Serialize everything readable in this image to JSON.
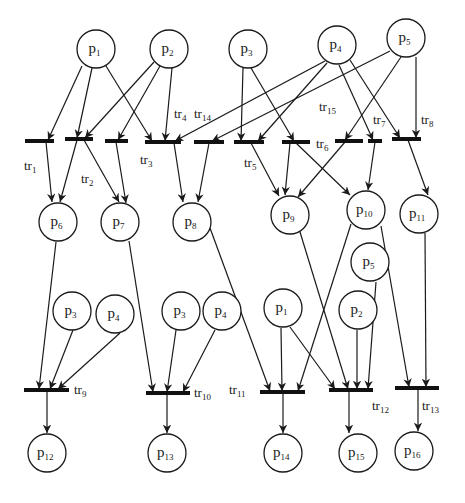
{
  "diagram": {
    "type": "petri-net",
    "colors": {
      "stroke": "#1a1a1a",
      "bar": "#111111",
      "background": "#ffffff"
    },
    "places": [
      {
        "id": "p1a",
        "base": "p",
        "sub": "1",
        "x": 96,
        "y": 49
      },
      {
        "id": "p2a",
        "base": "p",
        "sub": "2",
        "x": 169,
        "y": 49
      },
      {
        "id": "p3a",
        "base": "p",
        "sub": "3",
        "x": 248,
        "y": 49
      },
      {
        "id": "p4a",
        "base": "p",
        "sub": "4",
        "x": 337,
        "y": 45
      },
      {
        "id": "p5a",
        "base": "p",
        "sub": "5",
        "x": 406,
        "y": 38
      },
      {
        "id": "p6",
        "base": "p",
        "sub": "6",
        "x": 58,
        "y": 222
      },
      {
        "id": "p7",
        "base": "p",
        "sub": "7",
        "x": 120,
        "y": 222
      },
      {
        "id": "p8",
        "base": "p",
        "sub": "8",
        "x": 192,
        "y": 222
      },
      {
        "id": "p9",
        "base": "p",
        "sub": "9",
        "x": 290,
        "y": 215
      },
      {
        "id": "p10",
        "base": "p",
        "sub": "10",
        "x": 366,
        "y": 210
      },
      {
        "id": "p11",
        "base": "p",
        "sub": "11",
        "x": 419,
        "y": 214
      },
      {
        "id": "p5b",
        "base": "p",
        "sub": "5",
        "x": 370,
        "y": 262
      },
      {
        "id": "p3b",
        "base": "p",
        "sub": "3",
        "x": 72,
        "y": 311
      },
      {
        "id": "p4b",
        "base": "p",
        "sub": "4",
        "x": 115,
        "y": 314
      },
      {
        "id": "p3c",
        "base": "p",
        "sub": "3",
        "x": 181,
        "y": 311
      },
      {
        "id": "p4c",
        "base": "p",
        "sub": "4",
        "x": 222,
        "y": 311
      },
      {
        "id": "p1b",
        "base": "p",
        "sub": "1",
        "x": 283,
        "y": 308
      },
      {
        "id": "p2b",
        "base": "p",
        "sub": "2",
        "x": 358,
        "y": 310
      },
      {
        "id": "p12",
        "base": "p",
        "sub": "12",
        "x": 47,
        "y": 453
      },
      {
        "id": "p13",
        "base": "p",
        "sub": "13",
        "x": 167,
        "y": 453
      },
      {
        "id": "p14",
        "base": "p",
        "sub": "14",
        "x": 283,
        "y": 453
      },
      {
        "id": "p15",
        "base": "p",
        "sub": "15",
        "x": 358,
        "y": 453
      },
      {
        "id": "p16",
        "base": "p",
        "sub": "16",
        "x": 414,
        "y": 451
      }
    ],
    "transitions": [
      {
        "id": "tr1",
        "x1": 25,
        "x2": 54,
        "y": 141,
        "label": {
          "base": "tr",
          "sub": "1",
          "x": 24,
          "y": 170
        }
      },
      {
        "id": "tr2",
        "x1": 65,
        "x2": 93,
        "y": 139,
        "label": {
          "base": "tr",
          "sub": "2",
          "x": 81,
          "y": 183
        }
      },
      {
        "id": "tr4",
        "x1": 105,
        "x2": 128,
        "y": 141,
        "label": {
          "base": "tr",
          "sub": "4",
          "x": 174,
          "y": 118
        }
      },
      {
        "id": "tr3",
        "x1": 145,
        "x2": 181,
        "y": 142,
        "label": {
          "base": "tr",
          "sub": "3",
          "x": 140,
          "y": 164
        }
      },
      {
        "id": "tr14",
        "x1": 194,
        "x2": 224,
        "y": 142,
        "label": {
          "base": "tr",
          "sub": "14",
          "x": 194,
          "y": 118
        }
      },
      {
        "id": "tr5",
        "x1": 234,
        "x2": 264,
        "y": 142,
        "label": {
          "base": "tr",
          "sub": "5",
          "x": 244,
          "y": 167
        }
      },
      {
        "id": "tr6",
        "x1": 282,
        "x2": 310,
        "y": 142,
        "label": {
          "base": "tr",
          "sub": "6",
          "x": 316,
          "y": 148
        }
      },
      {
        "id": "tr15",
        "x1": 335,
        "x2": 363,
        "y": 141,
        "label": {
          "base": "tr",
          "sub": "15",
          "x": 319,
          "y": 111
        }
      },
      {
        "id": "tr7",
        "x1": 368,
        "x2": 382,
        "y": 141,
        "label": {
          "base": "tr",
          "sub": "7",
          "x": 373,
          "y": 124
        }
      },
      {
        "id": "tr8",
        "x1": 392,
        "x2": 421,
        "y": 139,
        "label": {
          "base": "tr",
          "sub": "8",
          "x": 421,
          "y": 124
        }
      },
      {
        "id": "tr9",
        "x1": 24,
        "x2": 69,
        "y": 390,
        "label": {
          "base": "tr",
          "sub": "9",
          "x": 74,
          "y": 394
        }
      },
      {
        "id": "tr10",
        "x1": 146,
        "x2": 190,
        "y": 393,
        "label": {
          "base": "tr",
          "sub": "10",
          "x": 194,
          "y": 397
        }
      },
      {
        "id": "tr11",
        "x1": 260,
        "x2": 305,
        "y": 392,
        "label": {
          "base": "tr",
          "sub": "11",
          "x": 229,
          "y": 394
        }
      },
      {
        "id": "tr12",
        "x1": 329,
        "x2": 373,
        "y": 390,
        "label": {
          "base": "tr",
          "sub": "12",
          "x": 372,
          "y": 410
        }
      },
      {
        "id": "tr13",
        "x1": 395,
        "x2": 439,
        "y": 388,
        "label": {
          "base": "tr",
          "sub": "13",
          "x": 422,
          "y": 410
        }
      }
    ],
    "arcs": [
      {
        "from": "p1a",
        "to": "tr1",
        "x1": 82,
        "y1": 66,
        "x2": 48,
        "y2": 140
      },
      {
        "from": "p1a",
        "to": "tr2",
        "x1": 92,
        "y1": 68,
        "x2": 77,
        "y2": 138
      },
      {
        "from": "p1a",
        "to": "tr3",
        "x1": 106,
        "y1": 66,
        "x2": 152,
        "y2": 141
      },
      {
        "from": "p2a",
        "to": "tr2",
        "x1": 154,
        "y1": 62,
        "x2": 85,
        "y2": 138
      },
      {
        "from": "p2a",
        "to": "tr4",
        "x1": 160,
        "y1": 66,
        "x2": 118,
        "y2": 140
      },
      {
        "from": "p2a",
        "to": "tr3",
        "x1": 172,
        "y1": 68,
        "x2": 165,
        "y2": 141
      },
      {
        "from": "p4a",
        "to": "tr3",
        "x1": 325,
        "y1": 61,
        "x2": 175,
        "y2": 141
      },
      {
        "from": "p5a",
        "to": "tr14",
        "x1": 390,
        "y1": 51,
        "x2": 212,
        "y2": 141
      },
      {
        "from": "p4a",
        "to": "tr5",
        "x1": 327,
        "y1": 63,
        "x2": 258,
        "y2": 141
      },
      {
        "from": "p3a",
        "to": "tr5",
        "x1": 243,
        "y1": 68,
        "x2": 241,
        "y2": 141
      },
      {
        "from": "p3a",
        "to": "tr6",
        "x1": 251,
        "y1": 68,
        "x2": 294,
        "y2": 141
      },
      {
        "from": "p5a",
        "to": "tr15",
        "x1": 401,
        "y1": 57,
        "x2": 345,
        "y2": 140
      },
      {
        "from": "p4a",
        "to": "tr7",
        "x1": 339,
        "y1": 65,
        "x2": 373,
        "y2": 140
      },
      {
        "from": "p4a",
        "to": "tr8",
        "x1": 350,
        "y1": 60,
        "x2": 400,
        "y2": 138
      },
      {
        "from": "p5a",
        "to": "tr8",
        "x1": 416,
        "y1": 57,
        "x2": 416,
        "y2": 138
      },
      {
        "from": "tr1",
        "to": "p6",
        "x1": 46,
        "y1": 142,
        "x2": 52,
        "y2": 202
      },
      {
        "from": "tr2",
        "to": "p6",
        "x1": 77,
        "y1": 140,
        "x2": 60,
        "y2": 202
      },
      {
        "from": "tr2",
        "to": "p7",
        "x1": 84,
        "y1": 140,
        "x2": 119,
        "y2": 202
      },
      {
        "from": "tr4",
        "to": "p7",
        "x1": 116,
        "y1": 142,
        "x2": 126,
        "y2": 203
      },
      {
        "from": "tr3",
        "to": "p8",
        "x1": 174,
        "y1": 143,
        "x2": 183,
        "y2": 202
      },
      {
        "from": "tr14",
        "to": "p8",
        "x1": 209,
        "y1": 143,
        "x2": 198,
        "y2": 202
      },
      {
        "from": "tr5",
        "to": "p9",
        "x1": 251,
        "y1": 143,
        "x2": 279,
        "y2": 196
      },
      {
        "from": "tr6",
        "to": "p9",
        "x1": 290,
        "y1": 143,
        "x2": 285,
        "y2": 195
      },
      {
        "from": "tr15",
        "to": "p9",
        "x1": 345,
        "y1": 142,
        "x2": 298,
        "y2": 197
      },
      {
        "from": "tr6",
        "to": "p10",
        "x1": 296,
        "y1": 143,
        "x2": 350,
        "y2": 195
      },
      {
        "from": "tr7",
        "to": "p10",
        "x1": 375,
        "y1": 142,
        "x2": 368,
        "y2": 190
      },
      {
        "from": "tr8",
        "to": "p11",
        "x1": 408,
        "y1": 140,
        "x2": 428,
        "y2": 195
      },
      {
        "from": "p6",
        "to": "tr9",
        "x1": 56,
        "y1": 242,
        "x2": 39,
        "y2": 389
      },
      {
        "from": "p3b",
        "to": "tr9",
        "x1": 73,
        "y1": 330,
        "x2": 50,
        "y2": 389
      },
      {
        "from": "p4b",
        "to": "tr9",
        "x1": 120,
        "y1": 333,
        "x2": 58,
        "y2": 389
      },
      {
        "from": "p7",
        "to": "tr10",
        "x1": 129,
        "y1": 241,
        "x2": 153,
        "y2": 392
      },
      {
        "from": "p3c",
        "to": "tr10",
        "x1": 176,
        "y1": 330,
        "x2": 167,
        "y2": 392
      },
      {
        "from": "p4c",
        "to": "tr10",
        "x1": 215,
        "y1": 330,
        "x2": 183,
        "y2": 392
      },
      {
        "from": "p8",
        "to": "tr11",
        "x1": 210,
        "y1": 228,
        "x2": 270,
        "y2": 391
      },
      {
        "from": "p1b",
        "to": "tr11",
        "x1": 281,
        "y1": 328,
        "x2": 282,
        "y2": 391
      },
      {
        "from": "p10",
        "to": "tr11",
        "x1": 351,
        "y1": 224,
        "x2": 298,
        "y2": 391
      },
      {
        "from": "p1b",
        "to": "tr12",
        "x1": 290,
        "y1": 327,
        "x2": 335,
        "y2": 389
      },
      {
        "from": "p9",
        "to": "tr12",
        "x1": 300,
        "y1": 232,
        "x2": 348,
        "y2": 389
      },
      {
        "from": "p2b",
        "to": "tr12",
        "x1": 357,
        "y1": 330,
        "x2": 357,
        "y2": 389
      },
      {
        "from": "p5b",
        "to": "tr12",
        "x1": 376,
        "y1": 282,
        "x2": 368,
        "y2": 389
      },
      {
        "from": "p10",
        "to": "tr13",
        "x1": 381,
        "y1": 226,
        "x2": 409,
        "y2": 387
      },
      {
        "from": "p11",
        "to": "tr13",
        "x1": 425,
        "y1": 233,
        "x2": 426,
        "y2": 387
      },
      {
        "from": "tr9",
        "to": "p12",
        "x1": 47,
        "y1": 391,
        "x2": 47,
        "y2": 433
      },
      {
        "from": "tr10",
        "to": "p13",
        "x1": 167,
        "y1": 394,
        "x2": 167,
        "y2": 433
      },
      {
        "from": "tr11",
        "to": "p14",
        "x1": 283,
        "y1": 393,
        "x2": 283,
        "y2": 433
      },
      {
        "from": "tr12",
        "to": "p15",
        "x1": 349,
        "y1": 391,
        "x2": 349,
        "y2": 433
      },
      {
        "from": "tr13",
        "to": "p16",
        "x1": 418,
        "y1": 389,
        "x2": 418,
        "y2": 431
      }
    ]
  }
}
